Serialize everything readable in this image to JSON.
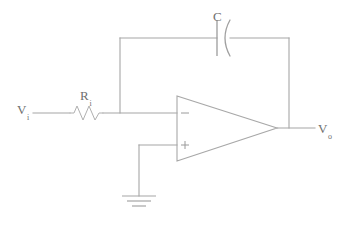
{
  "diagram": {
    "type": "schematic",
    "line_color": "#a6a6a6",
    "text_color": "#6f6f6f",
    "background": "#ffffff"
  },
  "labels": {
    "input_voltage": {
      "symbol": "V",
      "subscript": "i"
    },
    "input_resistor": {
      "symbol": "R",
      "subscript": "i"
    },
    "feedback_capacitor": {
      "symbol": "C",
      "subscript": ""
    },
    "output_voltage": {
      "symbol": "V",
      "subscript": "o"
    }
  },
  "opamp": {
    "inverting_input_sign": "−",
    "noninverting_input_sign": "+"
  },
  "components": [
    {
      "name": "input-source-terminal",
      "label": "Vi"
    },
    {
      "name": "input-resistor",
      "label": "Ri"
    },
    {
      "name": "feedback-capacitor",
      "label": "C"
    },
    {
      "name": "operational-amplifier",
      "label": ""
    },
    {
      "name": "ground-symbol",
      "label": ""
    },
    {
      "name": "output-terminal",
      "label": "Vo"
    }
  ]
}
